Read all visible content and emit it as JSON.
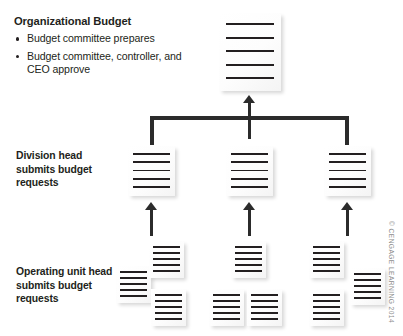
{
  "figure": {
    "background_color": "#ffffff",
    "ink_color": "#231f20",
    "connector_color": "#2b2b2b",
    "credit": "© CENGAGE LEARNING 2014"
  },
  "levels": [
    {
      "id": "organizational-budget",
      "title": "Organizational Budget",
      "bullets": [
        "Budget committee prepares",
        "Budget committee, controller, and CEO approve"
      ]
    },
    {
      "id": "division-head",
      "label": "Division head submits budget requests"
    },
    {
      "id": "operating-unit",
      "label": "Operating unit head submits budget requests"
    }
  ],
  "documents": {
    "top": [
      {
        "name": "organizational-budget-document",
        "lines": 5
      }
    ],
    "division": [
      {
        "name": "division-document-1",
        "lines": 5
      },
      {
        "name": "division-document-2",
        "lines": 5
      },
      {
        "name": "division-document-3",
        "lines": 5
      }
    ],
    "operating": [
      {
        "name": "operating-document-1",
        "lines": 5
      },
      {
        "name": "operating-document-2",
        "lines": 5
      },
      {
        "name": "operating-document-3",
        "lines": 5
      },
      {
        "name": "operating-document-4",
        "lines": 5
      },
      {
        "name": "operating-document-5",
        "lines": 5
      },
      {
        "name": "operating-document-6",
        "lines": 5
      },
      {
        "name": "operating-document-7",
        "lines": 5
      },
      {
        "name": "operating-document-8",
        "lines": 5
      },
      {
        "name": "operating-document-9",
        "lines": 5
      }
    ]
  },
  "connectors": {
    "to_top": "upward-arrow-to-organizational-budget",
    "bracket": "three-branch-bracket",
    "to_division": [
      "upward-arrow-to-division-1",
      "upward-arrow-to-division-2",
      "upward-arrow-to-division-3"
    ]
  }
}
